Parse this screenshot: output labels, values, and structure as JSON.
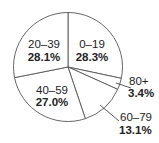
{
  "chart_data": {
    "type": "pie",
    "title": "",
    "title_visible": false,
    "start_angle_deg": 0,
    "direction": "clockwise",
    "slices": [
      {
        "label": "0–19",
        "value": 28.3,
        "value_label": "28.3%"
      },
      {
        "label": "80+",
        "value": 3.4,
        "value_label": "3.4%"
      },
      {
        "label": "60–79",
        "value": 13.1,
        "value_label": "13.1%"
      },
      {
        "label": "40–59",
        "value": 27.0,
        "value_label": "27.0%"
      },
      {
        "label": "20–39",
        "value": 28.1,
        "value_label": "28.1%"
      }
    ],
    "categories": [
      "0–19",
      "80+",
      "60–79",
      "40–59",
      "20–39"
    ],
    "values": [
      28.3,
      3.4,
      13.1,
      27.0,
      28.1
    ],
    "units": "%",
    "legend": "none",
    "labels_inside": [
      "0–19",
      "20–39",
      "40–59"
    ],
    "labels_outside_with_leader": [
      "80+",
      "60–79"
    ]
  },
  "colors": {
    "slice_fill": "#ffffff",
    "stroke": "#555555",
    "text": "#222222"
  },
  "labels": {
    "s0": {
      "name": "0–19",
      "pct": "28.3%"
    },
    "s1": {
      "name": "80+",
      "pct": "3.4%"
    },
    "s2": {
      "name": "60–79",
      "pct": "13.1%"
    },
    "s3": {
      "name": "40–59",
      "pct": "27.0%"
    },
    "s4": {
      "name": "20–39",
      "pct": "28.1%"
    }
  }
}
